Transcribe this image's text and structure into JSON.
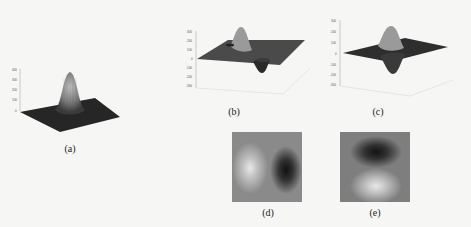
{
  "figure": {
    "panels": [
      {
        "id": "a",
        "caption": "(a)",
        "type": "surface3d",
        "description": "2D Gaussian surface, single positive peak",
        "z_ticks": [
          "0",
          "100",
          "200",
          "300",
          "400"
        ]
      },
      {
        "id": "b",
        "caption": "(b)",
        "type": "surface3d",
        "description": "First derivative of Gaussian along x: positive lobe and negative lobe",
        "z_ticks": [
          "300",
          "200",
          "100",
          "0",
          "-100",
          "-200",
          "-300"
        ]
      },
      {
        "id": "c",
        "caption": "(c)",
        "type": "surface3d",
        "description": "First derivative of Gaussian along y: positive lobe and negative lobe",
        "z_ticks": [
          "300",
          "200",
          "100",
          "0",
          "-100",
          "-200",
          "-300"
        ]
      },
      {
        "id": "d",
        "caption": "(d)",
        "type": "intensity-image",
        "description": "Bright lobe left, dark lobe right"
      },
      {
        "id": "e",
        "caption": "(e)",
        "type": "intensity-image",
        "description": "Dark lobe top, bright lobe bottom"
      }
    ]
  },
  "colors": {
    "background": "#f6f6f4",
    "surface_dark": "#2a2a2a",
    "surface_mid": "#777777",
    "axis": "#999999"
  }
}
